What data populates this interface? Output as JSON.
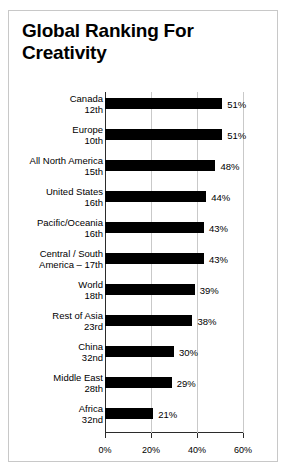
{
  "chart_data": {
    "type": "bar",
    "orientation": "horizontal",
    "title": "Global Ranking For Creativity",
    "xlabel": "",
    "ylabel": "",
    "xlim": [
      0,
      60
    ],
    "grid": true,
    "legend": "none",
    "xticks": [
      "0%",
      "20%",
      "40%",
      "60%"
    ],
    "xtick_values": [
      0,
      20,
      40,
      60
    ],
    "bar_color": "#000000",
    "categories": [
      "Canada",
      "Europe",
      "All North America",
      "United States",
      "Pacific/Oceania",
      "Central / South America – 17th",
      "World",
      "Rest of Asia",
      "China",
      "Middle East",
      "Africa"
    ],
    "values": [
      51,
      51,
      48,
      44,
      43,
      43,
      39,
      38,
      30,
      29,
      21
    ],
    "data_labels": [
      "51%",
      "51%",
      "48%",
      "44%",
      "43%",
      "43%",
      "39%",
      "38%",
      "30%",
      "29%",
      "21%"
    ],
    "ranks": [
      "12th",
      "10th",
      "15th",
      "16th",
      "16th",
      "17th",
      "18th",
      "23rd",
      "32nd",
      "28th",
      "32nd"
    ],
    "rows": [
      {
        "name": "Canada",
        "rank": "12th",
        "value": 51,
        "label": "51%"
      },
      {
        "name": "Europe",
        "rank": "10th",
        "value": 51,
        "label": "51%"
      },
      {
        "name": "All North America",
        "rank": "15th",
        "value": 48,
        "label": "48%"
      },
      {
        "name": "United States",
        "rank": "16th",
        "value": 44,
        "label": "44%"
      },
      {
        "name": "Pacific/Oceania",
        "rank": "16th",
        "value": 43,
        "label": "43%"
      },
      {
        "name": "Central / South",
        "rank": "America – 17th",
        "value": 43,
        "label": "43%"
      },
      {
        "name": "World",
        "rank": "18th",
        "value": 39,
        "label": "39%"
      },
      {
        "name": "Rest of Asia",
        "rank": "23rd",
        "value": 38,
        "label": "38%"
      },
      {
        "name": "China",
        "rank": "32nd",
        "value": 30,
        "label": "30%"
      },
      {
        "name": "Middle East",
        "rank": "28th",
        "value": 29,
        "label": "29%"
      },
      {
        "name": "Africa",
        "rank": "32nd",
        "value": 21,
        "label": "21%"
      }
    ]
  }
}
